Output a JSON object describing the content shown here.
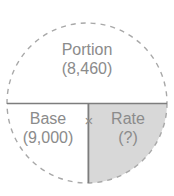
{
  "diagram": {
    "type": "portion-base-rate-circle",
    "shape_name": "dashed-circle",
    "colors": {
      "background": "#ffffff",
      "text": "#8b8b8b",
      "divider_line": "#7d7d7d",
      "dashed_outline": "#a8a8a8",
      "shaded_sector_fill": "#d8d8d8"
    },
    "circle": {
      "center_x": 87,
      "center_y": 103,
      "radius": 80
    },
    "sections": {
      "top": {
        "name": "Portion",
        "value": "(8,460)",
        "shaded": false
      },
      "bottom_left": {
        "name": "Base",
        "value": "(9,000)",
        "shaded": false
      },
      "bottom_right": {
        "name": "Rate",
        "value": "(?)",
        "shaded": true
      }
    },
    "operator": {
      "symbol": "×",
      "icon_name": "multiply-icon"
    }
  }
}
